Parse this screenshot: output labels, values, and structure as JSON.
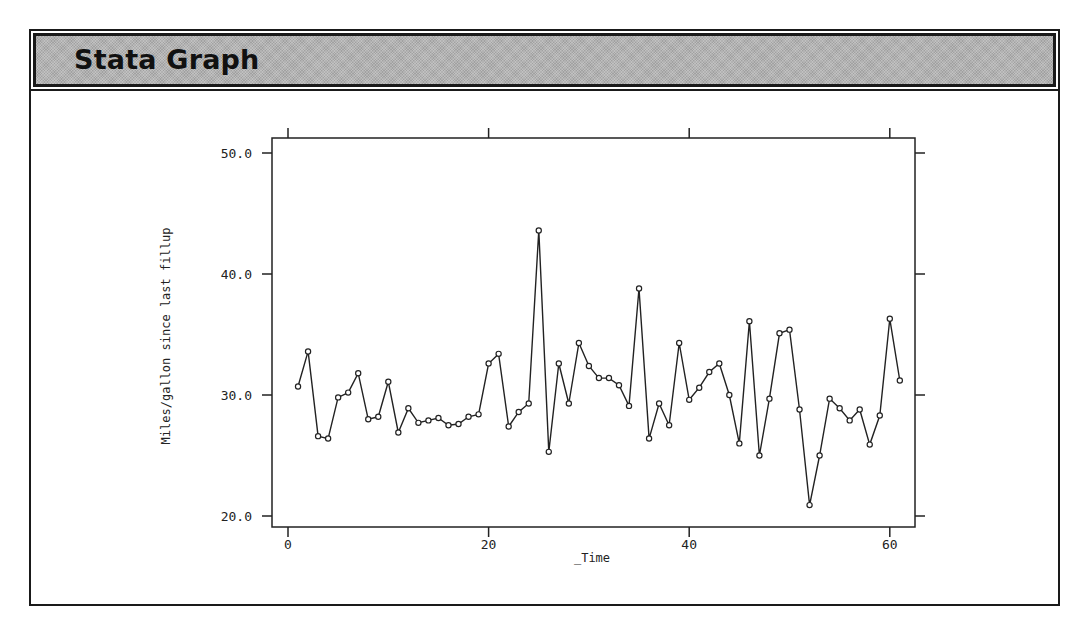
{
  "header": {
    "title": "Stata Graph"
  },
  "chart_data": {
    "type": "line",
    "title": "",
    "xlabel": "_Time",
    "ylabel": "Miles/gallon since last fillup",
    "xlim": [
      0,
      62
    ],
    "ylim": [
      19,
      51
    ],
    "xticks": [
      0,
      20,
      40,
      60
    ],
    "xtick_labels": [
      "0",
      "20",
      "40",
      "60"
    ],
    "yticks": [
      20,
      30,
      40,
      50
    ],
    "ytick_labels": [
      "20.0",
      "30.0",
      "40.0",
      "50.0"
    ],
    "grid": false,
    "legend": null,
    "markers": "hollow-circle",
    "x": [
      1,
      2,
      3,
      4,
      5,
      6,
      7,
      8,
      9,
      10,
      11,
      12,
      13,
      14,
      15,
      16,
      17,
      18,
      19,
      20,
      21,
      22,
      23,
      24,
      25,
      26,
      27,
      28,
      29,
      30,
      31,
      32,
      33,
      34,
      35,
      36,
      37,
      38,
      39,
      40,
      41,
      42,
      43,
      44,
      45,
      46,
      47,
      48,
      49,
      50,
      51,
      52,
      53,
      54,
      55,
      56,
      57,
      58,
      59,
      60,
      61
    ],
    "series": [
      {
        "name": "Miles/gallon since last fillup",
        "values": [
          30.7,
          33.6,
          26.6,
          26.4,
          29.8,
          30.2,
          31.8,
          28.0,
          28.2,
          31.1,
          26.9,
          28.9,
          27.7,
          27.9,
          28.1,
          27.5,
          27.6,
          28.2,
          28.4,
          32.6,
          33.4,
          27.4,
          28.6,
          29.3,
          43.6,
          25.3,
          32.6,
          29.3,
          34.3,
          32.4,
          31.4,
          31.4,
          30.8,
          29.1,
          38.8,
          26.4,
          29.3,
          27.5,
          34.3,
          29.6,
          30.6,
          31.9,
          32.6,
          30.0,
          26.0,
          36.1,
          25.0,
          29.7,
          35.1,
          35.4,
          28.8,
          20.9,
          25.0,
          29.7,
          28.9,
          27.9,
          28.8,
          25.9,
          28.3,
          36.3,
          31.2
        ]
      }
    ],
    "colors": {
      "line": "#222222",
      "axis": "#222222",
      "marker_fill": "#ffffff"
    }
  }
}
